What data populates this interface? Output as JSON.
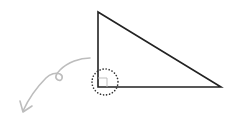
{
  "diagram": {
    "type": "right-triangle-with-right-angle-callout",
    "colors": {
      "background": "#ffffff",
      "triangle_stroke": "#222222",
      "right_angle_marker": "#b8b8b8",
      "dotted_circle": "#333333",
      "arrow": "#bdbdbd"
    },
    "triangle": {
      "vertices": [
        [
          98,
          12
        ],
        [
          98,
          87
        ],
        [
          221,
          87
        ]
      ],
      "right_angle_vertex": [
        98,
        87
      ]
    },
    "right_angle_marker": {
      "x": 98,
      "y": 78,
      "size": 9
    },
    "highlight_circle": {
      "cx": 105,
      "cy": 82,
      "r": 13,
      "style": "dotted"
    },
    "arrow": {
      "description": "curved grey arrow with a small loop, pointing down-left away from the right angle",
      "start": [
        90,
        57
      ],
      "loop_center": [
        58,
        76
      ],
      "end": [
        22,
        112
      ]
    }
  }
}
